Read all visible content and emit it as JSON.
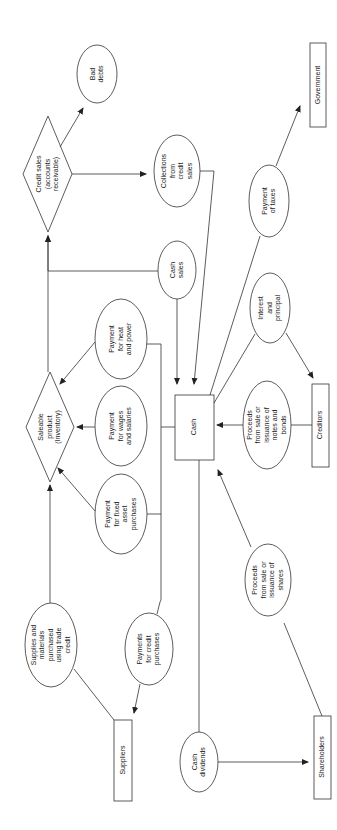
{
  "diagram": {
    "colors": {
      "stroke": "#333333",
      "background": "#ffffff",
      "text": "#222222"
    },
    "nodes": [
      {
        "id": "bad_debts",
        "shape": "ellipse",
        "label": "Bad\ndebts"
      },
      {
        "id": "credit_sales",
        "shape": "diamond",
        "label": "Credit sales\n(accounts\nreceivable)"
      },
      {
        "id": "collections",
        "shape": "ellipse",
        "label": "Collections\nfrom\ncredit\nsales"
      },
      {
        "id": "government",
        "shape": "rect",
        "label": "Government"
      },
      {
        "id": "payment_taxes",
        "shape": "ellipse",
        "label": "Payment\nof taxes"
      },
      {
        "id": "cash_sales",
        "shape": "ellipse",
        "label": "Cash\nsales"
      },
      {
        "id": "interest_principal",
        "shape": "ellipse",
        "label": "Interest\nand\nprincipal"
      },
      {
        "id": "heat_power",
        "shape": "ellipse",
        "label": "Payment\nfor heat\nand power"
      },
      {
        "id": "saleable_product",
        "shape": "diamond",
        "label": "Saleable\nproduct\n(Inventory)"
      },
      {
        "id": "wages_salaries",
        "shape": "ellipse",
        "label": "Payment\nfor wages\nand salaries"
      },
      {
        "id": "cash",
        "shape": "rect",
        "label": "Cash"
      },
      {
        "id": "proceeds_notes",
        "shape": "ellipse",
        "label": "Proceeds\nfrom sale or\nissuance of\nnotes and\nbonds"
      },
      {
        "id": "creditors",
        "shape": "rect",
        "label": "Creditors"
      },
      {
        "id": "fixed_asset",
        "shape": "ellipse",
        "label": "Payment\nfor fixed\nasset\npurchases"
      },
      {
        "id": "proceeds_shares",
        "shape": "ellipse",
        "label": "Proceeds\nfrom sale or\nissuance of\nshares"
      },
      {
        "id": "supplies",
        "shape": "ellipse",
        "label": "Supplies and\nmaterials\npurchased\nusing trade\ncredit"
      },
      {
        "id": "credit_purchases",
        "shape": "ellipse",
        "label": "Payments\nfor credit\npurchases"
      },
      {
        "id": "suppliers",
        "shape": "rect",
        "label": "Suppliers"
      },
      {
        "id": "cash_dividends",
        "shape": "ellipse",
        "label": "Cash\ndividends"
      },
      {
        "id": "shareholders",
        "shape": "rect",
        "label": "Shareholders"
      }
    ],
    "edges": [
      {
        "from": "credit_sales",
        "to": "bad_debts"
      },
      {
        "from": "credit_sales",
        "to": "collections"
      },
      {
        "from": "collections",
        "to": "cash"
      },
      {
        "from": "cash_sales",
        "to": "cash"
      },
      {
        "from": "cash_sales",
        "to": "credit_sales"
      },
      {
        "from": "cash",
        "to": "government",
        "via": "payment_taxes"
      },
      {
        "from": "cash",
        "to": "creditors",
        "via": "interest_principal"
      },
      {
        "from": "creditors",
        "to": "cash",
        "via": "proceeds_notes"
      },
      {
        "from": "cash",
        "to": "saleable_product",
        "via": "heat_power"
      },
      {
        "from": "cash",
        "to": "saleable_product",
        "via": "wages_salaries"
      },
      {
        "from": "cash",
        "to": "saleable_product",
        "via": "fixed_asset"
      },
      {
        "from": "saleable_product",
        "to": "credit_sales"
      },
      {
        "from": "suppliers",
        "to": "saleable_product",
        "via": "supplies"
      },
      {
        "from": "cash",
        "to": "suppliers",
        "via": "credit_purchases"
      },
      {
        "from": "shareholders",
        "to": "cash",
        "via": "proceeds_shares"
      },
      {
        "from": "cash",
        "to": "shareholders",
        "via": "cash_dividends"
      }
    ]
  }
}
